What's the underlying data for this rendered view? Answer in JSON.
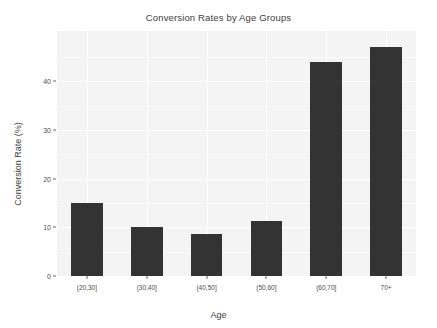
{
  "chart_data": {
    "type": "bar",
    "title": "Conversion Rates by Age Groups",
    "xlabel": "Age",
    "ylabel": "Conversion Rate (%)",
    "categories": [
      "(20,30]",
      "(30,40]",
      "(40,50]",
      "(50,60]",
      "(60,70]",
      "70+"
    ],
    "values": [
      15.0,
      10.0,
      8.7,
      11.2,
      43.9,
      47.0
    ],
    "ylim": [
      0,
      50.3
    ],
    "yticks": [
      0,
      10,
      20,
      30,
      40
    ],
    "ytick_labels": [
      "0",
      "10",
      "20",
      "30",
      "40"
    ],
    "grid": true,
    "legend": null,
    "bar_color": "#333333",
    "panel_color": "#f4f4f4",
    "gridline_color": "#ffffff",
    "background_color": "#ffffff"
  }
}
